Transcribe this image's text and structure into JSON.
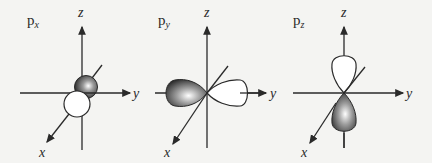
{
  "diagram": {
    "panels": [
      {
        "id": "px",
        "label_main": "p",
        "label_sub": "x",
        "axes": {
          "z": "z",
          "y": "y",
          "x": "x"
        },
        "shaded_lobe": "+x back (upper, dark)",
        "open_lobe": "-x front (lower, white)"
      },
      {
        "id": "py",
        "label_main": "p",
        "label_sub": "y",
        "axes": {
          "z": "z",
          "y": "y",
          "x": "x"
        },
        "shaded_lobe": "-y (left, dark)",
        "open_lobe": "+y (right, white)"
      },
      {
        "id": "pz",
        "label_main": "p",
        "label_sub": "z",
        "axes": {
          "z": "z",
          "y": "y",
          "x": "x"
        },
        "shaded_lobe": "-z (lower, dark)",
        "open_lobe": "+z (upper, white)"
      }
    ],
    "colors": {
      "background": "#f4f4f2",
      "line": "#2a2a2a",
      "lobe_dark": "#3a3a3a",
      "lobe_light": "#ffffff"
    }
  }
}
